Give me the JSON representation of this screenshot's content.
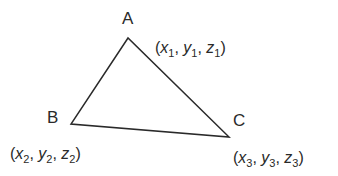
{
  "diagram": {
    "type": "triangle",
    "stroke_color": "#2a2a2a",
    "vertices": [
      {
        "id": "A",
        "label": "A",
        "point": [
          128,
          38
        ],
        "coord": {
          "x": "x",
          "x_sub": "1",
          "y": "y",
          "y_sub": "1",
          "z": "z",
          "z_sub": "1"
        }
      },
      {
        "id": "B",
        "label": "B",
        "point": [
          71,
          124
        ],
        "coord": {
          "x": "x",
          "x_sub": "2",
          "y": "y",
          "y_sub": "2",
          "z": "z",
          "z_sub": "2"
        }
      },
      {
        "id": "C",
        "label": "C",
        "point": [
          229,
          137
        ],
        "coord": {
          "x": "x",
          "x_sub": "3",
          "y": "y",
          "y_sub": "3",
          "z": "z",
          "z_sub": "3"
        }
      }
    ],
    "punct": {
      "open": "(",
      "close": ")",
      "sep": ", "
    }
  }
}
